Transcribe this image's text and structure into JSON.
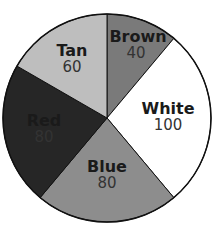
{
  "chart_data": {
    "type": "pie",
    "title": "",
    "start_angle_deg": 0,
    "direction": "clockwise",
    "slices": [
      {
        "label": "Brown",
        "value": 40,
        "color": "#7a7a7a"
      },
      {
        "label": "White",
        "value": 100,
        "color": "#ffffff"
      },
      {
        "label": "Blue",
        "value": 80,
        "color": "#8d8d8d"
      },
      {
        "label": "Red",
        "value": 80,
        "color": "#262626"
      },
      {
        "label": "Tan",
        "value": 60,
        "color": "#bebebe"
      }
    ],
    "categories": [
      "Brown",
      "White",
      "Blue",
      "Red",
      "Tan"
    ],
    "values": [
      40,
      100,
      80,
      80,
      60
    ],
    "total": 360,
    "legend": "none (labels inside slices)"
  },
  "labels": {
    "brown": {
      "name": "Brown",
      "value": "40"
    },
    "white": {
      "name": "White",
      "value": "100"
    },
    "blue": {
      "name": "Blue",
      "value": "80"
    },
    "red": {
      "name": "Red",
      "value": "80"
    },
    "tan": {
      "name": "Tan",
      "value": "60"
    }
  }
}
